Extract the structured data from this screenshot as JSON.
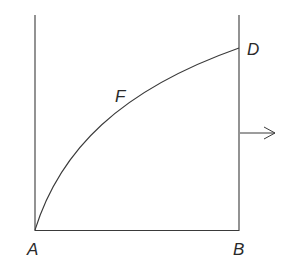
{
  "diagram": {
    "labels": {
      "A": "A",
      "B": "B",
      "D": "D",
      "F": "F"
    },
    "colors": {
      "stroke": "#3a3a3a",
      "text": "#2a2a2a",
      "background": "#ffffff"
    }
  }
}
